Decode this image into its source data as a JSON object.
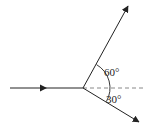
{
  "diagram": {
    "type": "ray-diagram",
    "colors": {
      "line": "#222222",
      "dashed": "#888888",
      "background": "#ffffff"
    },
    "vertex": {
      "x": 83,
      "y": 88
    },
    "rays": [
      {
        "name": "incident",
        "from": [
          10,
          88
        ],
        "to": [
          83,
          88
        ],
        "arrow_at": [
          45,
          88
        ]
      },
      {
        "name": "upper",
        "from": [
          83,
          88
        ],
        "to": [
          128,
          6
        ],
        "angle_deg": 60
      },
      {
        "name": "lower",
        "from": [
          83,
          88
        ],
        "to": [
          139,
          122
        ],
        "angle_deg": 30
      }
    ],
    "reference_line": {
      "style": "dashed",
      "from": [
        83,
        88
      ],
      "to": [
        146,
        88
      ]
    },
    "angle_labels": [
      {
        "text": "60°",
        "x": 104,
        "y": 76
      },
      {
        "text": "30°",
        "x": 106,
        "y": 103
      }
    ]
  }
}
